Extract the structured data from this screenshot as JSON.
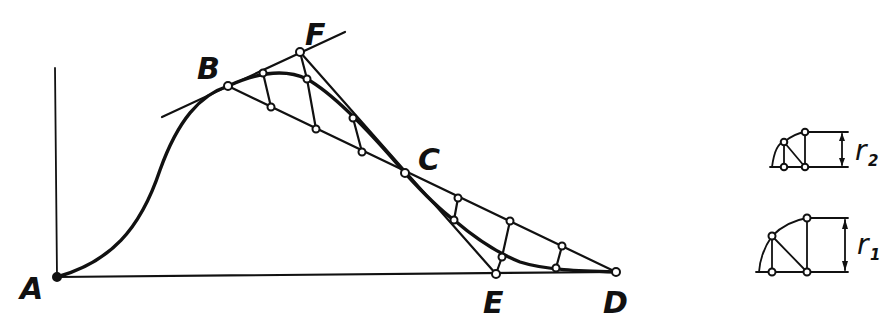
{
  "diagram": {
    "title": "",
    "point_labels": {
      "A": "A",
      "B": "B",
      "C": "C",
      "D": "D",
      "E": "E",
      "F": "F"
    },
    "radius_labels": {
      "r2_main": "r",
      "r2_sub": "2",
      "r1_main": "r",
      "r1_sub": "1"
    },
    "colors": {
      "ink": "#111111",
      "background": "#ffffff"
    },
    "points": {
      "A": [
        57,
        277
      ],
      "B": [
        228,
        86
      ],
      "F": [
        300,
        52
      ],
      "C": [
        405,
        173
      ],
      "E": [
        496,
        274
      ],
      "D": [
        616,
        272
      ]
    }
  }
}
